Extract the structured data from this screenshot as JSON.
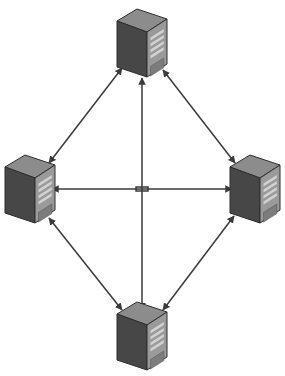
{
  "diagram": {
    "type": "network-topology",
    "background_color": "#ffffff",
    "width": 285,
    "height": 376,
    "node_count": 4,
    "link_count": 6,
    "topology": "full-mesh-diamond"
  },
  "palette": {
    "background": "#ffffff",
    "line": "#3a3a3a",
    "server_side_dark": "#474747",
    "server_side_shadow": "#3c3c3c",
    "server_top": "#8c8c8c",
    "server_top_dark": "#6f6f6f",
    "server_face": "#9a9a9a",
    "server_face_edge": "#b4b4b4",
    "server_vent": "#d2d2d2",
    "server_vent_shadow": "#5a5a5a",
    "server_bay": "#7c7c7c",
    "server_bay_edge": "#a8a8a8",
    "server_outline": "#2e2e2e"
  },
  "nodes": [
    {
      "id": "server-top",
      "name": "server-top",
      "label": "",
      "position": "top",
      "icon": "server-tower-icon",
      "cx": 142,
      "cy": 43
    },
    {
      "id": "server-left",
      "name": "server-left",
      "label": "",
      "position": "left",
      "icon": "server-tower-icon",
      "cx": 30,
      "cy": 189
    },
    {
      "id": "server-right",
      "name": "server-right",
      "label": "",
      "position": "right",
      "icon": "server-tower-icon",
      "cx": 255,
      "cy": 189
    },
    {
      "id": "server-bottom",
      "name": "server-bottom",
      "label": "",
      "position": "bottom",
      "icon": "server-tower-icon",
      "cx": 142,
      "cy": 336
    }
  ],
  "links": [
    {
      "id": "link-top-left",
      "name": "link-top-left",
      "from": "server-top",
      "to": "server-left",
      "direction": "bidirectional",
      "label": "",
      "x1": 122,
      "y1": 68,
      "x2": 49,
      "y2": 163
    },
    {
      "id": "link-top-right",
      "name": "link-top-right",
      "from": "server-top",
      "to": "server-right",
      "direction": "bidirectional",
      "label": "",
      "x1": 163,
      "y1": 70,
      "x2": 235,
      "y2": 163
    },
    {
      "id": "link-left-bottom",
      "name": "link-left-bottom",
      "from": "server-left",
      "to": "server-bottom",
      "direction": "bidirectional",
      "label": "",
      "x1": 49,
      "y1": 218,
      "x2": 122,
      "y2": 310
    },
    {
      "id": "link-bottom-right",
      "name": "link-bottom-right",
      "from": "server-bottom",
      "to": "server-right",
      "direction": "bidirectional",
      "label": "",
      "x1": 163,
      "y1": 310,
      "x2": 234,
      "y2": 216
    },
    {
      "id": "link-left-right",
      "name": "link-left-right",
      "from": "server-left",
      "to": "server-right",
      "direction": "bidirectional",
      "label": "",
      "x1": 52,
      "y1": 189,
      "x2": 232,
      "y2": 189
    },
    {
      "id": "link-top-bottom",
      "name": "link-top-bottom",
      "from": "server-top",
      "to": "server-bottom",
      "direction": "bidirectional",
      "label": "",
      "x1": 142,
      "y1": 310,
      "x2": 142,
      "y2": 78,
      "crossing": "hop-over-horizontal"
    }
  ],
  "crossing": {
    "name": "line-hop-crossing",
    "x": 142,
    "y": 189,
    "style": "bridge-hop",
    "description": "vertical link hops over horizontal link"
  }
}
